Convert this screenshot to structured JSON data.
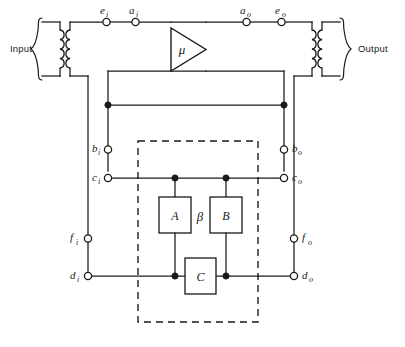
{
  "diagram": {
    "type": "schematic",
    "ports": {
      "input_label": "Input",
      "output_label": "Output"
    },
    "amplifier": {
      "symbol": "μ",
      "shape": "triangle",
      "direction": "right"
    },
    "feedback_network": {
      "symbol": "β",
      "enclosure": "dashed",
      "components": [
        {
          "label": "A",
          "name": "component-a"
        },
        {
          "label": "B",
          "name": "component-b"
        },
        {
          "label": "C",
          "name": "component-c"
        }
      ]
    },
    "terminals": [
      {
        "id": "e_i",
        "base": "e",
        "sub": "i",
        "name": "terminal-ei"
      },
      {
        "id": "a_i",
        "base": "a",
        "sub": "i",
        "name": "terminal-ai"
      },
      {
        "id": "a_o",
        "base": "a",
        "sub": "o",
        "name": "terminal-ao"
      },
      {
        "id": "e_o",
        "base": "e",
        "sub": "o",
        "name": "terminal-eo"
      },
      {
        "id": "b_i",
        "base": "b",
        "sub": "i",
        "name": "terminal-bi"
      },
      {
        "id": "b_o",
        "base": "b",
        "sub": "o",
        "name": "terminal-bo"
      },
      {
        "id": "c_i",
        "base": "c",
        "sub": "i",
        "name": "terminal-ci"
      },
      {
        "id": "c_o",
        "base": "c",
        "sub": "o",
        "name": "terminal-co"
      },
      {
        "id": "f_i",
        "base": "f",
        "sub": "i",
        "name": "terminal-fi"
      },
      {
        "id": "f_o",
        "base": "f",
        "sub": "o",
        "name": "terminal-fo"
      },
      {
        "id": "d_i",
        "base": "d",
        "sub": "i",
        "name": "terminal-di"
      },
      {
        "id": "d_o",
        "base": "d",
        "sub": "o",
        "name": "terminal-do"
      }
    ],
    "colors": {
      "ink": "#1a1a1a",
      "background": "#ffffff"
    }
  }
}
